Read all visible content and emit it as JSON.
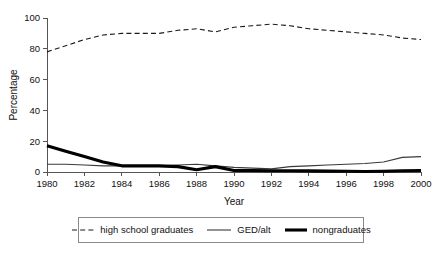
{
  "chart_data": {
    "type": "line",
    "title": "",
    "xlabel": "Year",
    "ylabel": "Percentage",
    "xlim": [
      1980,
      2000
    ],
    "ylim": [
      0,
      100
    ],
    "grid": false,
    "legend_position": "bottom",
    "xticks": [
      1980,
      1982,
      1984,
      1986,
      1988,
      1990,
      1992,
      1994,
      1996,
      1998,
      2000
    ],
    "yticks": [
      0,
      20,
      40,
      60,
      80,
      100
    ],
    "x": [
      1980,
      1981,
      1982,
      1983,
      1984,
      1985,
      1986,
      1987,
      1988,
      1989,
      1990,
      1991,
      1992,
      1993,
      1994,
      1995,
      1996,
      1997,
      1998,
      1999,
      2000
    ],
    "series": [
      {
        "name": "high school graduates",
        "style": "dashed",
        "color": "#1a1a1a",
        "values": [
          78,
          82,
          86,
          89,
          90,
          90,
          90,
          92,
          93,
          91,
          94,
          95,
          96,
          95,
          93,
          92,
          91,
          90,
          89,
          87,
          86
        ]
      },
      {
        "name": "GED/alt",
        "style": "thin-solid",
        "color": "#3a3a3a",
        "values": [
          5,
          5,
          4.5,
          4,
          4,
          4,
          4,
          4.5,
          5,
          4,
          3,
          2.5,
          2,
          3.5,
          4,
          4.5,
          5,
          5.5,
          6.5,
          9.5,
          10
        ]
      },
      {
        "name": "nongraduates",
        "style": "thick-solid",
        "color": "#000000",
        "values": [
          17,
          13.5,
          10,
          6.5,
          4,
          4,
          4,
          3.5,
          1.5,
          3.5,
          1,
          1,
          0.8,
          0.8,
          0.7,
          0.6,
          0.5,
          0.3,
          0.5,
          0.8,
          1
        ]
      }
    ]
  },
  "legend": {
    "items": [
      {
        "label": "high school graduates",
        "style": "dashed"
      },
      {
        "label": "GED/alt",
        "style": "thin-solid"
      },
      {
        "label": "nongraduates",
        "style": "thick-solid"
      }
    ]
  }
}
